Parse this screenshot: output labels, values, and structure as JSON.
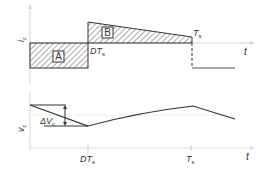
{
  "figure": {
    "top_plot": {
      "y_label": "i",
      "y_label_sub": "c",
      "x_label": "t",
      "region_a_label": "A",
      "region_b_label": "B",
      "dt_label": "DT",
      "dt_label_sub": "s",
      "ts_label": "T",
      "ts_label_sub": "s"
    },
    "bottom_plot": {
      "y_label": "v",
      "y_label_sub": "c",
      "x_label": "t",
      "ripple_label": "ΔV",
      "ripple_label_sub": "c",
      "dt_tick_label": "DT",
      "dt_tick_label_sub": "s",
      "ts_tick_label": "T",
      "ts_tick_label_sub": "s"
    },
    "colors": {
      "line": "#333333",
      "axis": "#cccccc",
      "hatch": "#555555"
    }
  }
}
